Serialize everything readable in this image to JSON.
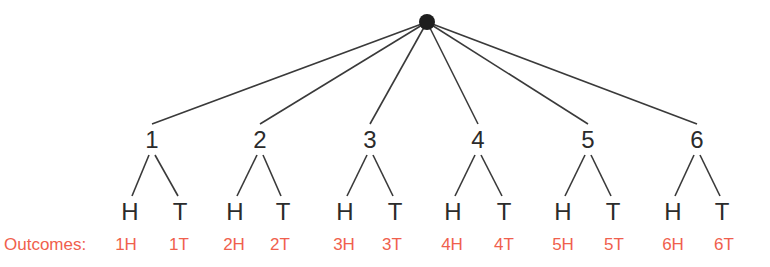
{
  "diagram": {
    "root": {
      "x": 427,
      "y": 22
    },
    "line_color": "#3a3a3a",
    "outcome_color": "#f0604d",
    "outcomes_label": "Outcomes:",
    "branches": [
      {
        "label": "1",
        "x": 152,
        "children": [
          {
            "label": "H",
            "x": 130,
            "outcome": "1H",
            "ox": 126
          },
          {
            "label": "T",
            "x": 180,
            "outcome": "1T",
            "ox": 179
          }
        ]
      },
      {
        "label": "2",
        "x": 260,
        "children": [
          {
            "label": "H",
            "x": 235,
            "outcome": "2H",
            "ox": 234
          },
          {
            "label": "T",
            "x": 283,
            "outcome": "2T",
            "ox": 280
          }
        ]
      },
      {
        "label": "3",
        "x": 370,
        "children": [
          {
            "label": "H",
            "x": 345,
            "outcome": "3H",
            "ox": 344
          },
          {
            "label": "T",
            "x": 395,
            "outcome": "3T",
            "ox": 392
          }
        ]
      },
      {
        "label": "4",
        "x": 478,
        "children": [
          {
            "label": "H",
            "x": 453,
            "outcome": "4H",
            "ox": 452
          },
          {
            "label": "T",
            "x": 504,
            "outcome": "4T",
            "ox": 504
          }
        ]
      },
      {
        "label": "5",
        "x": 588,
        "children": [
          {
            "label": "H",
            "x": 563,
            "outcome": "5H",
            "ox": 563
          },
          {
            "label": "T",
            "x": 613,
            "outcome": "5T",
            "ox": 614
          }
        ]
      },
      {
        "label": "6",
        "x": 697,
        "children": [
          {
            "label": "H",
            "x": 673,
            "outcome": "6H",
            "ox": 673
          },
          {
            "label": "T",
            "x": 722,
            "outcome": "6T",
            "ox": 724
          }
        ]
      }
    ]
  }
}
